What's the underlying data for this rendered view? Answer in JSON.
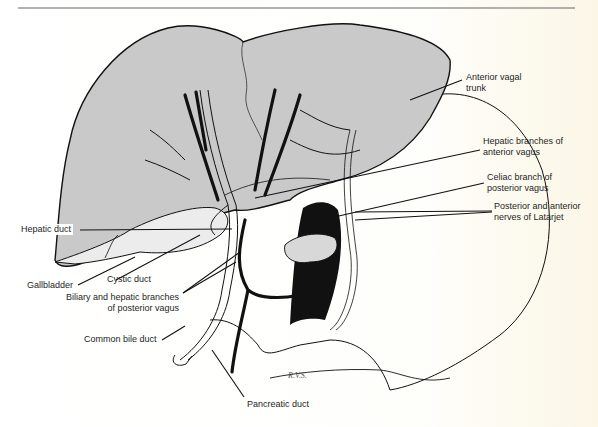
{
  "figure": {
    "title": "",
    "colors": {
      "liver": "#c9c9c9",
      "ink": "#111111",
      "paper": "#ffffff"
    },
    "labels": [
      {
        "id": "anterior-vagal-trunk",
        "lines": [
          "Anterior vagal",
          "trunk"
        ]
      },
      {
        "id": "hepatic-branches-anterior-vagus",
        "lines": [
          "Hepatic branches of",
          "anterior vagus"
        ]
      },
      {
        "id": "celiac-branch-posterior-vagus",
        "lines": [
          "Celiac branch of",
          "posterior vagus"
        ]
      },
      {
        "id": "latarjet-nerves",
        "lines": [
          "Posterior and anterior",
          "nerves of Latarjet"
        ]
      },
      {
        "id": "hepatic-duct",
        "lines": [
          "Hepatic duct"
        ]
      },
      {
        "id": "gallbladder",
        "lines": [
          "Gallbladder"
        ]
      },
      {
        "id": "cystic-duct",
        "lines": [
          "Cystic duct"
        ]
      },
      {
        "id": "biliary-hepatic-branches",
        "lines": [
          "Biliary and hepatic branches",
          "of posterior vagus"
        ]
      },
      {
        "id": "common-bile-duct",
        "lines": [
          "Common bile duct"
        ]
      },
      {
        "id": "pancreatic-duct",
        "lines": [
          "Pancreatic duct"
        ]
      }
    ],
    "signature": "R.V.S."
  }
}
